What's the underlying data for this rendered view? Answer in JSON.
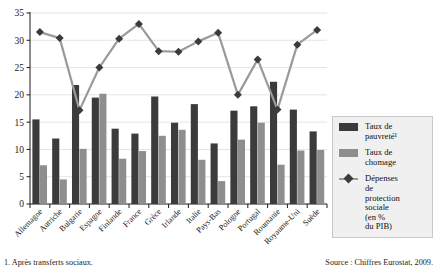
{
  "chart_data": {
    "type": "bar",
    "title": "",
    "subtitle": "",
    "xlabel": "",
    "ylabel": "",
    "ylim": [
      0,
      35
    ],
    "yticks": [
      0,
      5,
      10,
      15,
      20,
      25,
      30,
      35
    ],
    "grid": true,
    "legend_position": "right",
    "categories": [
      "Allemagne",
      "Autriche",
      "Bulgarie",
      "Espagne",
      "Finlande",
      "France",
      "Grèce",
      "Irlande",
      "Italie",
      "Pays-Bas",
      "Pologne",
      "Portugal",
      "Roumanie",
      "Royaume-Uni",
      "Suède"
    ],
    "series": [
      {
        "name": "Taux de pauvreté",
        "kind": "bar",
        "color": "#3b3b3b",
        "values": [
          15.5,
          12.0,
          21.8,
          19.5,
          13.8,
          12.9,
          19.7,
          14.9,
          18.3,
          11.1,
          17.1,
          17.9,
          22.4,
          17.3,
          13.3
        ]
      },
      {
        "name": "Taux de chomage",
        "kind": "bar",
        "color": "#8e8e8e",
        "values": [
          7.1,
          4.5,
          10.1,
          20.2,
          8.3,
          9.7,
          12.5,
          13.6,
          8.1,
          4.2,
          11.8,
          14.9,
          7.2,
          9.8,
          9.9
        ]
      },
      {
        "name": "Dépenses de protection sociale",
        "kind": "line",
        "color": "#3b3b3b",
        "values": [
          31.5,
          30.4,
          17.2,
          25.0,
          30.3,
          33.0,
          28.0,
          27.9,
          29.8,
          31.4,
          20.0,
          26.5,
          17.3,
          29.2,
          31.9
        ]
      }
    ],
    "legend": [
      {
        "label": "Taux de\npauvreté¹",
        "marker": "square",
        "color": "#3b3b3b"
      },
      {
        "label": "Taux de\nchomage",
        "marker": "square",
        "color": "#8e8e8e"
      },
      {
        "label": "Dépenses\nde\nprotection\nsociale\n(en %\ndu PIB)",
        "marker": "diamond",
        "color": "#3b3b3b"
      }
    ]
  },
  "footer": {
    "note": "1. Après transferts sociaux.",
    "source": "Source : Chiffres Eurostat, 2009."
  }
}
